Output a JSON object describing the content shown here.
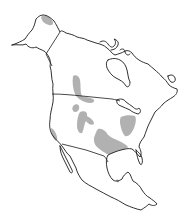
{
  "map": {
    "subject": "North America outline map",
    "style": "black outline on white with gray shaded distribution areas",
    "colors": {
      "background": "#ffffff",
      "outline": "#1a1a1a",
      "range_fill": "#a9a9a9"
    },
    "regions_shown": [
      "Alaska",
      "Canada",
      "Greenland (partial absent)",
      "United States",
      "Mexico",
      "Central America"
    ],
    "shaded_areas": [
      {
        "id": "north-alaska",
        "label": "Northern Alaska coast"
      },
      {
        "id": "northern-plains",
        "label": "Northern Great Plains (Alberta/Saskatchewan to Montana)"
      },
      {
        "id": "great-basin",
        "label": "Great Basin / Rocky Mountain patch"
      },
      {
        "id": "colorado-plateau",
        "label": "Colorado Plateau / central Rockies"
      },
      {
        "id": "california-coast",
        "label": "California coast"
      },
      {
        "id": "southern-plains",
        "label": "Southern Plains / Texas"
      },
      {
        "id": "ohio-valley",
        "label": "Ohio Valley / eastern interior"
      },
      {
        "id": "gulf-coast-mexico",
        "label": "Gulf coast of Mexico (small patch)"
      }
    ]
  }
}
